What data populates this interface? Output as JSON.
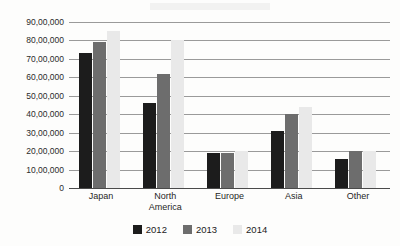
{
  "chart_data": {
    "type": "bar",
    "title": "",
    "subtitle": "",
    "xlabel": "",
    "ylabel": "",
    "categories": [
      "Japan",
      "North America",
      "Europe",
      "Asia",
      "Other"
    ],
    "category_lines": [
      [
        "Japan"
      ],
      [
        "North",
        "America"
      ],
      [
        "Europe"
      ],
      [
        "Asia"
      ],
      [
        "Other"
      ]
    ],
    "series": [
      {
        "name": "2012",
        "color": "#1c1c1c",
        "values": [
          7300000,
          4600000,
          1900000,
          3100000,
          1600000
        ]
      },
      {
        "name": "2013",
        "color": "#6d6d6d",
        "values": [
          7900000,
          6200000,
          1900000,
          4000000,
          2000000
        ]
      },
      {
        "name": "2014",
        "color": "#e9e9e9",
        "values": [
          8500000,
          8000000,
          2000000,
          4400000,
          2000000
        ]
      }
    ],
    "ylim": [
      0,
      9000000
    ],
    "ytick_values": [
      0,
      1000000,
      2000000,
      3000000,
      4000000,
      5000000,
      6000000,
      7000000,
      8000000,
      9000000
    ],
    "ytick_labels": [
      "0",
      "10,00,000",
      "20,00,000",
      "30,00,000",
      "40,00,000",
      "50,00,000",
      "60,00,000",
      "70,00,000",
      "80,00,000",
      "90,00,000"
    ],
    "grid": true,
    "legend_position": "bottom",
    "number_format": "indian-lakh"
  },
  "legend": {
    "items": [
      {
        "label": "2012",
        "color": "#1c1c1c"
      },
      {
        "label": "2013",
        "color": "#6d6d6d"
      },
      {
        "label": "2014",
        "color": "#e9e9e9"
      }
    ]
  },
  "background_text": {
    "lines": [
      "",
      "",
      "",
      "",
      "",
      "",
      "",
      ""
    ]
  }
}
